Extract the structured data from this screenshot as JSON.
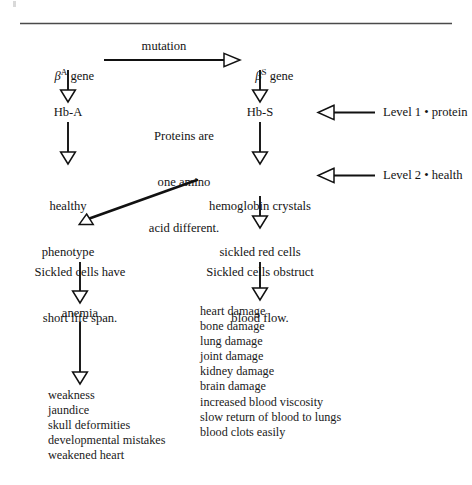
{
  "figure": {
    "rule": {
      "visible": true
    },
    "colors": {
      "ink": "#141414",
      "rule": "#3a3a3a",
      "line": "#111111"
    }
  },
  "nodes": {
    "beta_a_gene": {
      "greek": "β",
      "sup": "A",
      "text": " gene"
    },
    "beta_s_gene": {
      "greek": "β",
      "sup": "S",
      "text": " gene"
    },
    "mutation_label": "mutation",
    "hb_a": "Hb-A",
    "hb_s": "Hb-S",
    "proteins_note": {
      "line1": "Proteins are",
      "line2": "one amino",
      "line3": "acid different."
    },
    "healthy_phenotype": {
      "line1": "healthy",
      "line2": "phenotype"
    },
    "hemoglobin_crystals": {
      "line1": "hemoglobin crystals",
      "line2": "sickled red cells"
    },
    "sickled_short_life": {
      "line1": "Sickled cells have",
      "line2": "short life span."
    },
    "sickled_obstruct": {
      "line1": "Sickled cells obstruct",
      "line2": "blood flow."
    },
    "anemia": "anemia"
  },
  "levels": [
    {
      "name": "level-1",
      "label": "Level 1 • protein"
    },
    {
      "name": "level-2",
      "label": "Level 2 • health"
    }
  ],
  "lists": {
    "anemia_effects": [
      "weakness",
      "jaundice",
      "skull deformities",
      "developmental mistakes",
      "weakened heart"
    ],
    "obstruction_effects": [
      "heart damage",
      "bone damage",
      "lung damage",
      "joint damage",
      "kidney damage",
      "brain damage",
      "increased blood viscosity",
      "slow return of blood to lungs",
      "blood clots easily"
    ]
  },
  "chart_data": {
    "type": "diagram",
    "nodes": [
      {
        "id": "beta_a_gene",
        "label": "βA gene",
        "x": 68,
        "y": 60
      },
      {
        "id": "mutation",
        "label": "mutation",
        "x": 152,
        "y": 47
      },
      {
        "id": "beta_s_gene",
        "label": "βS gene",
        "x": 260,
        "y": 60
      },
      {
        "id": "hb_a",
        "label": "Hb-A",
        "x": 68,
        "y": 112
      },
      {
        "id": "proteins_note",
        "label": "Proteins are one amino acid different.",
        "x": 184,
        "y": 112
      },
      {
        "id": "hb_s",
        "label": "Hb-S",
        "x": 260,
        "y": 112
      },
      {
        "id": "level_1",
        "label": "Level 1 • protein",
        "x": 392,
        "y": 112
      },
      {
        "id": "healthy_phenotype",
        "label": "healthy phenotype",
        "x": 68,
        "y": 175
      },
      {
        "id": "hemoglobin_crystals",
        "label": "hemoglobin crystals sickled red cells",
        "x": 260,
        "y": 175
      },
      {
        "id": "level_2",
        "label": "Level 2 • health",
        "x": 392,
        "y": 175
      },
      {
        "id": "sickled_short_life",
        "label": "Sickled cells have short life span.",
        "x": 80,
        "y": 240
      },
      {
        "id": "sickled_obstruct",
        "label": "Sickled cells obstruct blood flow.",
        "x": 260,
        "y": 240
      },
      {
        "id": "anemia",
        "label": "anemia",
        "x": 80,
        "y": 313
      },
      {
        "id": "anemia_effects",
        "label": "weakness; jaundice; skull deformities; developmental mistakes; weakened heart",
        "x": 80,
        "y": 395
      },
      {
        "id": "obstruction_effects",
        "label": "heart damage; bone damage; lung damage; joint damage; kidney damage; brain damage; increased blood viscosity; slow return of blood to lungs; blood clots easily",
        "x": 260,
        "y": 310
      }
    ],
    "edges": [
      {
        "from": "beta_a_gene",
        "to": "beta_s_gene",
        "label": "mutation",
        "style": "open-arrow",
        "direction": "right"
      },
      {
        "from": "beta_a_gene",
        "to": "hb_a",
        "style": "open-arrow",
        "direction": "down"
      },
      {
        "from": "beta_s_gene",
        "to": "hb_s",
        "style": "open-arrow",
        "direction": "down"
      },
      {
        "from": "hb_a",
        "to": "healthy_phenotype",
        "style": "open-arrow",
        "direction": "down"
      },
      {
        "from": "hb_s",
        "to": "hemoglobin_crystals",
        "style": "open-arrow",
        "direction": "down"
      },
      {
        "from": "level_1",
        "to": "hb_s",
        "style": "open-arrow",
        "direction": "left"
      },
      {
        "from": "level_2",
        "to": "hemoglobin_crystals",
        "style": "open-arrow",
        "direction": "left"
      },
      {
        "from": "hemoglobin_crystals",
        "to": "sickled_short_life",
        "style": "open-arrow",
        "direction": "diagonal-down-left"
      },
      {
        "from": "hemoglobin_crystals",
        "to": "sickled_obstruct",
        "style": "open-arrow",
        "direction": "down"
      },
      {
        "from": "sickled_short_life",
        "to": "anemia",
        "style": "open-arrow",
        "direction": "down"
      },
      {
        "from": "sickled_obstruct",
        "to": "obstruction_effects",
        "style": "open-arrow",
        "direction": "down"
      },
      {
        "from": "anemia",
        "to": "anemia_effects",
        "style": "open-arrow",
        "direction": "down"
      }
    ]
  }
}
